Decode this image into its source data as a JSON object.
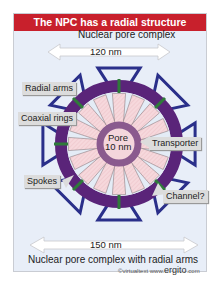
{
  "title": "The NPC has a radial structure",
  "top_dimension": {
    "caption": "Nuclear pore complex",
    "value": "120 nm"
  },
  "bottom_dimension": {
    "caption": "Nuclear pore complex with radial arms",
    "value": "150 nm"
  },
  "labels": {
    "radial_arms": "Radial arms",
    "coaxial_rings": "Coaxial rings",
    "spokes": "Spokes",
    "transporter": "Transporter",
    "channel": "Channel?",
    "pore_line1": "Pore",
    "pore_line2": "10 nm"
  },
  "credit": {
    "prefix": "©virtualtext  www.",
    "brand": "ergito",
    "suffix": ".com"
  },
  "colors": {
    "title_bar": "#c8202c",
    "background": "#e8eef8",
    "outer_ring": "#5a2479",
    "radial_arms": "#2a2f8a",
    "spokes_fill": "#f6d8dc",
    "pore_ring": "#8a5a8e",
    "pore_center": "#f4d6dc",
    "connector": "#2f7a3a"
  },
  "structure": {
    "radial_arm_count": 8,
    "spoke_count": 16
  }
}
